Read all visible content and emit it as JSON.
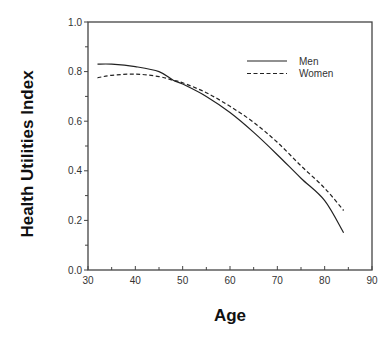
{
  "chart_data": {
    "type": "line",
    "title": "",
    "xlabel": "Age",
    "ylabel": "Health Utilities Index",
    "xlim": [
      30,
      90
    ],
    "ylim": [
      0.0,
      1.0
    ],
    "xticks": [
      30,
      40,
      50,
      60,
      70,
      80,
      90
    ],
    "xtick_labels": [
      "30",
      "40",
      "50",
      "60",
      "70",
      "80",
      "90"
    ],
    "yticks": [
      0.0,
      0.2,
      0.4,
      0.6,
      0.8,
      1.0
    ],
    "ytick_labels": [
      "0.0",
      "0.2",
      "0.4",
      "0.6",
      "0.8",
      "1.0"
    ],
    "grid": false,
    "legend_position": "upper right",
    "series": [
      {
        "name": "Men",
        "style": "solid",
        "x": [
          32,
          35,
          40,
          45,
          48,
          50,
          55,
          60,
          65,
          70,
          75,
          80,
          84
        ],
        "values": [
          0.83,
          0.83,
          0.82,
          0.8,
          0.765,
          0.75,
          0.7,
          0.635,
          0.555,
          0.465,
          0.37,
          0.28,
          0.15
        ]
      },
      {
        "name": "Women",
        "style": "dashed",
        "x": [
          32,
          35,
          40,
          45,
          48,
          50,
          55,
          60,
          65,
          70,
          75,
          80,
          84
        ],
        "values": [
          0.775,
          0.785,
          0.79,
          0.78,
          0.765,
          0.755,
          0.715,
          0.66,
          0.595,
          0.515,
          0.42,
          0.33,
          0.24
        ]
      }
    ]
  },
  "legend": {
    "items": [
      {
        "label": "Men",
        "style": "solid"
      },
      {
        "label": "Women",
        "style": "dashed"
      }
    ]
  },
  "colors": {
    "line": "#222222",
    "axis": "#444444"
  }
}
